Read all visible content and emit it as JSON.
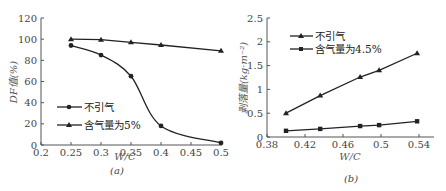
{
  "chart_data": [
    {
      "type": "line",
      "caption": "(a)",
      "title": "",
      "xlabel": "W/C",
      "ylabel": "DF值(%)",
      "xlim": [
        0.2,
        0.5
      ],
      "ylim": [
        0,
        120
      ],
      "xticks": [
        "0.2",
        "0.25",
        "0.3",
        "0.35",
        "0.4",
        "0.45",
        "0.5"
      ],
      "yticks": [
        "0",
        "20",
        "40",
        "60",
        "80",
        "100",
        "120"
      ],
      "grid": false,
      "legend_position": "lower left",
      "series": [
        {
          "name": "不引气",
          "marker": "circle",
          "x": [
            0.25,
            0.3,
            0.35,
            0.4,
            0.5
          ],
          "values": [
            94,
            85,
            65,
            18,
            2
          ]
        },
        {
          "name": "含气量为5%",
          "marker": "triangle",
          "x": [
            0.25,
            0.3,
            0.35,
            0.4,
            0.5
          ],
          "values": [
            100,
            99.5,
            97,
            94.5,
            89
          ]
        }
      ]
    },
    {
      "type": "line",
      "caption": "(b)",
      "title": "",
      "xlabel": "W/C",
      "ylabel": "剥落量(kg·m⁻²)",
      "xlim": [
        0.38,
        0.54
      ],
      "ylim": [
        0,
        2.5
      ],
      "xticks": [
        "0.38",
        "0.42",
        "0.46",
        "0.5",
        "0.54"
      ],
      "yticks": [
        "0",
        "0.5",
        "1",
        "1.5",
        "2",
        "2.5"
      ],
      "grid": false,
      "legend_position": "upper left",
      "series": [
        {
          "name": "不引气",
          "marker": "triangle",
          "x": [
            0.4,
            0.436,
            0.478,
            0.498,
            0.538
          ],
          "values": [
            0.5,
            0.87,
            1.26,
            1.4,
            1.76
          ]
        },
        {
          "name": "含气量为4.5%",
          "marker": "square",
          "x": [
            0.4,
            0.436,
            0.478,
            0.498,
            0.538
          ],
          "values": [
            0.13,
            0.17,
            0.23,
            0.25,
            0.33
          ]
        }
      ]
    }
  ],
  "labels": {
    "a": {
      "xlabel": "W/C",
      "ylabel": "DF值(%)",
      "caption": "(a)",
      "legend": [
        "不引气",
        "含气量为5%"
      ]
    },
    "b": {
      "xlabel": "W/C",
      "ylabel": "剥落量(kg·m⁻²)",
      "caption": "(b)",
      "legend": [
        "不引气",
        "含气量为4.5%"
      ]
    }
  }
}
